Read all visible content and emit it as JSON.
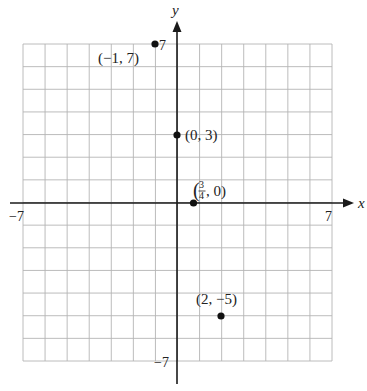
{
  "figure": {
    "x_axis_label": "x",
    "y_axis_label": "y",
    "tick_labels": {
      "x_min": "−7",
      "x_max": "7",
      "y_min": "−7",
      "y_max": "7"
    },
    "colors": {
      "grid": "#b4b4b4",
      "axis": "#1a1a1a",
      "point": "#111111",
      "text": "#222222"
    }
  },
  "chart_data": {
    "type": "scatter",
    "title": "",
    "xlabel": "x",
    "ylabel": "y",
    "xlim": [
      -7,
      7
    ],
    "ylim": [
      -7,
      7
    ],
    "grid": true,
    "grid_step": 1,
    "tick_labels_shown": [
      "-7",
      "7"
    ],
    "points": [
      {
        "x": -1,
        "y": 7,
        "label": "(−1, 7)"
      },
      {
        "x": 0,
        "y": 3,
        "label": "(0, 3)"
      },
      {
        "x": 0.75,
        "y": 0,
        "label": "(3/4, 0)",
        "label_display": {
          "open": "(",
          "num": "3",
          "den": "4",
          "rest": ", 0)"
        }
      },
      {
        "x": 2,
        "y": -5,
        "label": "(2, −5)"
      }
    ]
  }
}
